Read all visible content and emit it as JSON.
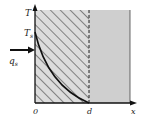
{
  "diagram": {
    "axis_labels": {
      "vertical": "T",
      "horizontal": "x"
    },
    "surface_temperature_label": "T",
    "surface_temperature_sub": "s",
    "heat_flux_label": "q",
    "heat_flux_sub": "s",
    "origin_label": "0",
    "depth_label": "d",
    "colors": {
      "hatched_region": "#d9d9d9",
      "gray_region": "#cfcfcf",
      "lines": "#222222"
    }
  }
}
